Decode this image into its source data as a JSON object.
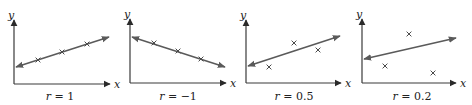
{
  "figure": {
    "panels": [
      {
        "id": "panel-1",
        "x_label": "x",
        "y_label": "y",
        "r_symbol": "r",
        "r_eq": " = ",
        "r_value": "1",
        "caption": "r = 1",
        "origin": [
          14,
          84
        ],
        "y_top": 20,
        "x_right": 110,
        "line": [
          [
            16,
            67
          ],
          [
            109,
            37
          ]
        ],
        "points": [
          [
            38,
            60
          ],
          [
            62,
            52
          ],
          [
            87,
            44
          ]
        ],
        "label_x": 60
      },
      {
        "id": "panel-2",
        "x_label": "x",
        "y_label": "y",
        "r_symbol": "r",
        "r_eq": " = ",
        "r_value": "−1",
        "caption": "r = −1",
        "origin": [
          130,
          83
        ],
        "y_top": 19,
        "x_right": 226,
        "line": [
          [
            132,
            37
          ],
          [
            225,
            67
          ]
        ],
        "points": [
          [
            154,
            43
          ],
          [
            178,
            51
          ],
          [
            201,
            59
          ]
        ],
        "label_x": 178
      },
      {
        "id": "panel-3",
        "x_label": "x",
        "y_label": "y",
        "r_symbol": "r",
        "r_eq": " = ",
        "r_value": "0.5",
        "caption": "r = 0.5",
        "origin": [
          246,
          83
        ],
        "y_top": 20,
        "x_right": 341,
        "line": [
          [
            248,
            66
          ],
          [
            340,
            36
          ]
        ],
        "points": [
          [
            269,
            67
          ],
          [
            294,
            43
          ],
          [
            318,
            50
          ]
        ],
        "label_x": 294
      },
      {
        "id": "panel-4",
        "x_label": "x",
        "y_label": "y",
        "r_symbol": "r",
        "r_eq": " = ",
        "r_value": "0.2",
        "caption": "r = 0.2",
        "origin": [
          362,
          83
        ],
        "y_top": 19,
        "x_right": 456,
        "line": [
          [
            364,
            59
          ],
          [
            456,
            38
          ]
        ],
        "points": [
          [
            385,
            66
          ],
          [
            409,
            34
          ],
          [
            433,
            73
          ]
        ],
        "label_x": 412
      }
    ]
  },
  "colors": {
    "axis": "#3a3a3a",
    "line": "#5a5a5a",
    "points": "#4a4a4a",
    "text": "#222222",
    "background": "#ffffff"
  }
}
